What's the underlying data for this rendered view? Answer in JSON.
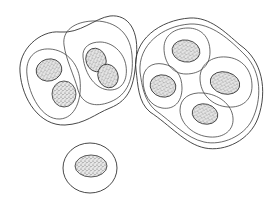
{
  "figure": {
    "groups": [
      {
        "name": "left-colony",
        "cells": 2,
        "nuclei": 4
      },
      {
        "name": "right-colony",
        "cells": 4,
        "nuclei": 4
      },
      {
        "name": "single-cell",
        "cells": 1,
        "nuclei": 1
      }
    ],
    "colors": {
      "line": "#333333",
      "background": "#ffffff",
      "stipple": "#555555"
    }
  }
}
